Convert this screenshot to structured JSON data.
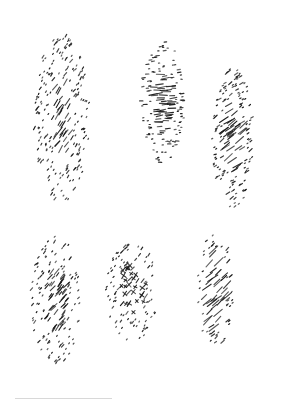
{
  "image": {
    "width": 291,
    "height": 411,
    "background": "#ffffff",
    "ink_color": "#1a1a1a",
    "description": "Six hand-drawn stippled/hatched texture patches on white paper"
  },
  "patches": [
    {
      "name": "patch-diagonal-dense-tall",
      "cx": 62,
      "cy": 118,
      "w": 56,
      "h": 170,
      "angle": -55,
      "len": 6,
      "count": 230,
      "style": "diagonal",
      "core": 0.45
    },
    {
      "name": "patch-horizontal-dashes",
      "cx": 163,
      "cy": 102,
      "w": 44,
      "h": 122,
      "angle": -5,
      "len": 6,
      "count": 170,
      "style": "horizontal",
      "core": 0.5
    },
    {
      "name": "patch-diagonal-wavy",
      "cx": 233,
      "cy": 138,
      "w": 42,
      "h": 140,
      "angle": -35,
      "len": 7,
      "count": 170,
      "style": "diagonal",
      "core": 0.55
    },
    {
      "name": "patch-diagonal-speckle",
      "cx": 56,
      "cy": 300,
      "w": 50,
      "h": 130,
      "angle": -50,
      "len": 5,
      "count": 170,
      "style": "diagonal",
      "core": 0.5
    },
    {
      "name": "patch-crosshatch-oval",
      "cx": 132,
      "cy": 291,
      "w": 52,
      "h": 100,
      "angle": -50,
      "len": 5,
      "count": 120,
      "style": "cross",
      "core": 0.55
    },
    {
      "name": "patch-diagonal-sparse",
      "cx": 215,
      "cy": 290,
      "w": 36,
      "h": 120,
      "angle": -40,
      "len": 8,
      "count": 80,
      "style": "diagonal",
      "core": 0.7
    }
  ],
  "rule": {
    "x": 15,
    "y": 398,
    "w": 97,
    "color": "#d8d8d8"
  }
}
